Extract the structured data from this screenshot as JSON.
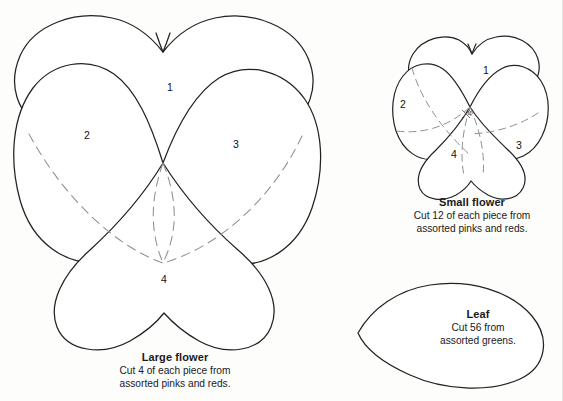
{
  "document": {
    "title": "Pansy Appliqué Pattern Templates",
    "background_color": "#fdfdfc",
    "outline_color": "#222222",
    "dashed_color": "#8a8a8a",
    "text_color": "#1a1a1a"
  },
  "templates": [
    {
      "id": "large-flower",
      "title": "Large flower",
      "instruction_line1": "Cut 4 of each piece from",
      "instruction_line2": "assorted pinks and reds.",
      "pieces": [
        {
          "label": "1",
          "x": 170,
          "y": 88
        },
        {
          "label": "2",
          "x": 87,
          "y": 136
        },
        {
          "label": "3",
          "x": 236,
          "y": 145
        },
        {
          "label": "4",
          "x": 164,
          "y": 280
        }
      ]
    },
    {
      "id": "small-flower",
      "title": "Small flower",
      "instruction_line1": "Cut 12 of each piece from",
      "instruction_line2": "assorted pinks and reds.",
      "pieces": [
        {
          "label": "1",
          "x": 486,
          "y": 71
        },
        {
          "label": "2",
          "x": 403,
          "y": 105
        },
        {
          "label": "3",
          "x": 519,
          "y": 146
        },
        {
          "label": "4",
          "x": 454,
          "y": 155
        }
      ],
      "center_mark": {
        "label": "4",
        "x": 466,
        "y": 113
      }
    },
    {
      "id": "leaf",
      "title": "Leaf",
      "instruction_line1": "Cut 56 from",
      "instruction_line2": "assorted greens."
    }
  ]
}
